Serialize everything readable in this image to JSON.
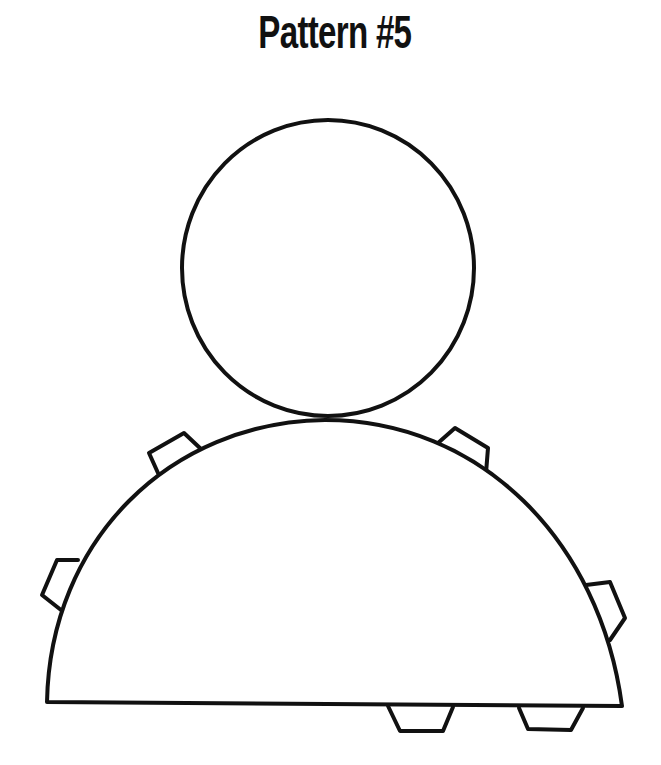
{
  "title": "Pattern #5",
  "colors": {
    "line": "#111111",
    "background": "#ffffff"
  },
  "pieces": {
    "head": "circle",
    "body": "half-circle",
    "tabs_count": 6
  }
}
